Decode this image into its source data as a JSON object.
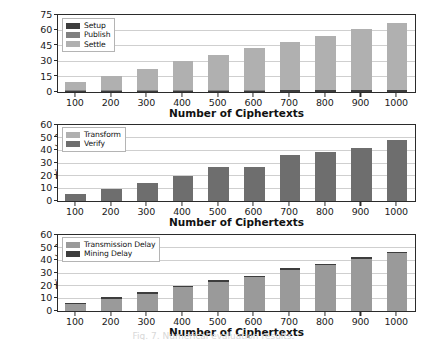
{
  "figure": {
    "caption_fragment": "Fig. 7. Numerical evaluation results.",
    "bar_colors": {
      "dark": "#3d3d3d",
      "mid": "#808080",
      "light": "#b0b0b0"
    },
    "grid_color": "#cfcfcf",
    "axis_color": "#2b2b2b"
  },
  "chart_data": [
    {
      "type": "bar",
      "stacked": true,
      "title": "",
      "xlabel": "Number of Ciphertexts",
      "ylabel": "Time(ms)",
      "categories": [
        "100",
        "200",
        "300",
        "400",
        "500",
        "600",
        "700",
        "800",
        "900",
        "1000"
      ],
      "ylim": [
        0,
        75
      ],
      "yticks": [
        0,
        15,
        30,
        45,
        60,
        75
      ],
      "grid": true,
      "legend_position": "upper left",
      "series": [
        {
          "name": "Setup",
          "color": "#3d3d3d",
          "values": [
            1.2,
            1.3,
            1.3,
            1.4,
            1.4,
            1.4,
            1.5,
            1.5,
            1.5,
            1.5
          ]
        },
        {
          "name": "Publish",
          "color": "#808080",
          "values": [
            0.3,
            0.3,
            0.3,
            0.3,
            0.3,
            0.3,
            0.4,
            0.4,
            0.4,
            0.4
          ]
        },
        {
          "name": "Settle",
          "color": "#b0b0b0",
          "values": [
            8.5,
            14.4,
            20.9,
            28.3,
            34.8,
            41.3,
            47.1,
            53.1,
            59.1,
            65.6
          ]
        }
      ],
      "totals": [
        10.0,
        16.0,
        22.5,
        30.0,
        36.5,
        43.0,
        49.0,
        55.0,
        61.0,
        67.5
      ]
    },
    {
      "type": "bar",
      "stacked": true,
      "title": "",
      "xlabel": "Number of Ciphertexts",
      "ylabel": "Time(s)",
      "categories": [
        "100",
        "200",
        "300",
        "400",
        "500",
        "600",
        "700",
        "800",
        "900",
        "1000"
      ],
      "ylim": [
        0,
        60
      ],
      "yticks": [
        0,
        10,
        20,
        30,
        40,
        50,
        60
      ],
      "grid": true,
      "legend_position": "upper left",
      "series": [
        {
          "name": "Transform",
          "color": "#b0b0b0",
          "values": [
            0.2,
            0.2,
            0.2,
            0.2,
            0.2,
            0.2,
            0.2,
            0.2,
            0.2,
            0.2
          ]
        },
        {
          "name": "Verify",
          "color": "#6e6e6e",
          "values": [
            5.1,
            9.4,
            13.8,
            19.3,
            26.3,
            26.8,
            35.8,
            38.6,
            41.8,
            48.3
          ]
        }
      ],
      "totals": [
        5.3,
        9.6,
        14.0,
        19.5,
        26.5,
        27.0,
        36.0,
        38.8,
        42.0,
        48.5
      ]
    },
    {
      "type": "bar",
      "stacked": true,
      "title": "",
      "xlabel": "Number of Ciphertexts",
      "ylabel": "Time(s)",
      "categories": [
        "100",
        "200",
        "300",
        "400",
        "500",
        "600",
        "700",
        "800",
        "900",
        "1000"
      ],
      "ylim": [
        0,
        60
      ],
      "yticks": [
        0,
        10,
        20,
        30,
        40,
        50,
        60
      ],
      "grid": true,
      "legend_position": "upper left",
      "series": [
        {
          "name": "Transmission Delay",
          "color": "#9a9a9a",
          "values": [
            5.2,
            9.2,
            13.8,
            18.8,
            23.1,
            26.8,
            32.3,
            36.4,
            41.4,
            45.7
          ]
        },
        {
          "name": "Mining Delay",
          "color": "#3d3d3d",
          "values": [
            1.0,
            1.5,
            1.2,
            1.2,
            1.2,
            1.2,
            2.0,
            1.1,
            1.1,
            1.1
          ]
        }
      ],
      "totals": [
        6.2,
        10.7,
        15.0,
        20.0,
        24.3,
        28.0,
        34.3,
        37.5,
        42.5,
        46.8
      ]
    }
  ]
}
